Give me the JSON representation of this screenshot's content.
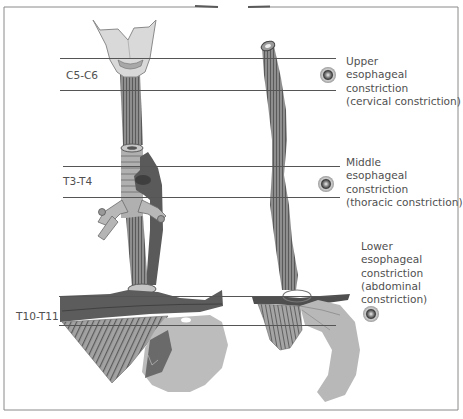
{
  "figure": {
    "colors": {
      "frame": "#8a8a8a",
      "guide_line": "#555555",
      "muscle": "#8c8c8c",
      "muscle_stripe": "#5e5e5e",
      "dark_tissue": "#575757",
      "cartilage": "#d9d9d9",
      "stomach": "#b9b9b9",
      "text": "#505050"
    },
    "vertebral_levels": [
      {
        "id": "upper",
        "label": "C5-C6"
      },
      {
        "id": "middle",
        "label": "T3-T4"
      },
      {
        "id": "lower",
        "label": "T10-T11"
      }
    ],
    "constrictions": [
      {
        "id": "upper",
        "lines": [
          "Upper",
          "esophageal",
          "constriction",
          "(cervical constriction)"
        ]
      },
      {
        "id": "middle",
        "lines": [
          "Middle",
          "esophageal",
          "constriction",
          "(thoracic constriction)"
        ]
      },
      {
        "id": "lower",
        "lines": [
          "Lower",
          "esophageal",
          "constriction",
          "(abdominal",
          "constriction)"
        ]
      }
    ],
    "marker_icon": "target-circle-icon"
  }
}
